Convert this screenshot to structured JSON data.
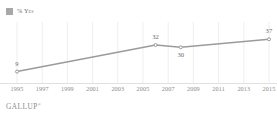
{
  "legend": {
    "icon": "square-swatch",
    "label": "% Yes",
    "color": "#a8a8a8"
  },
  "footer": {
    "brand": "GALLUP",
    "mark": "®"
  },
  "chart_data": {
    "type": "line",
    "title": "",
    "subtitle": "",
    "xlabel": "",
    "ylabel": "",
    "grid": "vertical",
    "legend_position": "top-left",
    "series": [
      {
        "name": "% Yes",
        "color": "#9b9b9b",
        "marker": "circle",
        "x": [
          1995,
          2006,
          2008,
          2015
        ],
        "values": [
          9,
          32,
          30,
          37
        ]
      }
    ],
    "point_labels": [
      {
        "x": 1995,
        "value": 9,
        "text": "9",
        "position": "above"
      },
      {
        "x": 2006,
        "value": 32,
        "text": "32",
        "position": "above"
      },
      {
        "x": 2008,
        "value": 30,
        "text": "30",
        "position": "below"
      },
      {
        "x": 2015,
        "value": 37,
        "text": "37",
        "position": "above"
      }
    ],
    "xticks": [
      1995,
      1997,
      1999,
      2001,
      2003,
      2005,
      2007,
      2009,
      2011,
      2013,
      2015
    ],
    "xtick_labels": [
      "1995",
      "1997",
      "1999",
      "2001",
      "2003",
      "2005",
      "2007",
      "2009",
      "2011",
      "2013",
      "2015"
    ],
    "xlim": [
      1995,
      2015
    ],
    "ylim": [
      0,
      45
    ],
    "yticks": []
  }
}
